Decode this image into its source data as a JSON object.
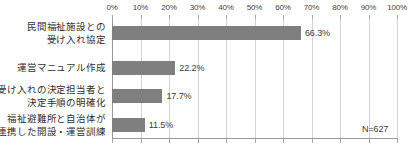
{
  "chart_data": {
    "type": "bar",
    "orientation": "horizontal",
    "title": "",
    "subtitle": "",
    "xlabel": "",
    "ylabel": "",
    "xlim": [
      0,
      100
    ],
    "xtick_labels": [
      "0%",
      "10%",
      "20%",
      "30%",
      "40%",
      "50%",
      "60%",
      "70%",
      "80%",
      "90%",
      "100%"
    ],
    "xticks": [
      0,
      10,
      20,
      30,
      40,
      50,
      60,
      70,
      80,
      90,
      100
    ],
    "grid": true,
    "grid_axis": "x",
    "legend": false,
    "legend_position": "none",
    "bar_color": "#7f7f7f",
    "categories": [
      {
        "lines": [
          "民間福祉施設との",
          "受け入れ協定"
        ],
        "value": 66.3,
        "value_label": "66.3%"
      },
      {
        "lines": [
          "運営マニュアル作成"
        ],
        "value": 22.2,
        "value_label": "22.2%"
      },
      {
        "lines": [
          "受け入れの決定担当者と",
          "決定手順の明確化"
        ],
        "value": 17.7,
        "value_label": "17.7%"
      },
      {
        "lines": [
          "福祉避難所と自治体が",
          "連携した開設・運営訓練"
        ],
        "value": 11.5,
        "value_label": "11.5%"
      }
    ],
    "values": [
      66.3,
      22.2,
      17.7,
      11.5
    ],
    "annotations": [
      {
        "text": "N=627",
        "position": "bottom-right"
      }
    ]
  }
}
